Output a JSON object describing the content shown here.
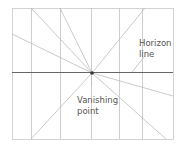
{
  "diagram": {
    "labels": {
      "horizon_line": "Horizon\nline",
      "vanishing_point": "Vanishing\npoint"
    },
    "colors": {
      "background": "#ffffff",
      "frame": "#c9c9c9",
      "guide_lines": "#bdbdbd",
      "horizon_line": "#666666",
      "vanishing_point": "#333333",
      "text": "#555555"
    },
    "frame": {
      "x": 12,
      "y": 8,
      "width": 161,
      "height": 131
    },
    "horizon_y": 72,
    "vanishing_point": {
      "x": 92,
      "y": 73
    },
    "vertical_lines_x": [
      31,
      60,
      91,
      119,
      142
    ],
    "rays_to": [
      {
        "x": 31,
        "y": 8
      },
      {
        "x": 60,
        "y": 8
      },
      {
        "x": 145,
        "y": 8
      },
      {
        "x": 12,
        "y": 34
      },
      {
        "x": 173,
        "y": 96
      },
      {
        "x": 31,
        "y": 139
      },
      {
        "x": 166,
        "y": 139
      }
    ]
  }
}
